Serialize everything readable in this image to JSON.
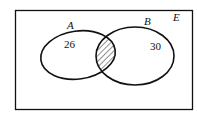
{
  "diagram": {
    "type": "venn",
    "universal_set": {
      "label": "E"
    },
    "sets": [
      {
        "name": "A",
        "label": "A",
        "region_only_value": "26"
      },
      {
        "name": "B",
        "label": "B",
        "region_only_value": "30"
      }
    ],
    "intersection": {
      "shaded": true,
      "pattern": "diagonal-hatch",
      "value": ""
    },
    "colors": {
      "stroke": "#111111",
      "background": "#ffffff"
    }
  }
}
